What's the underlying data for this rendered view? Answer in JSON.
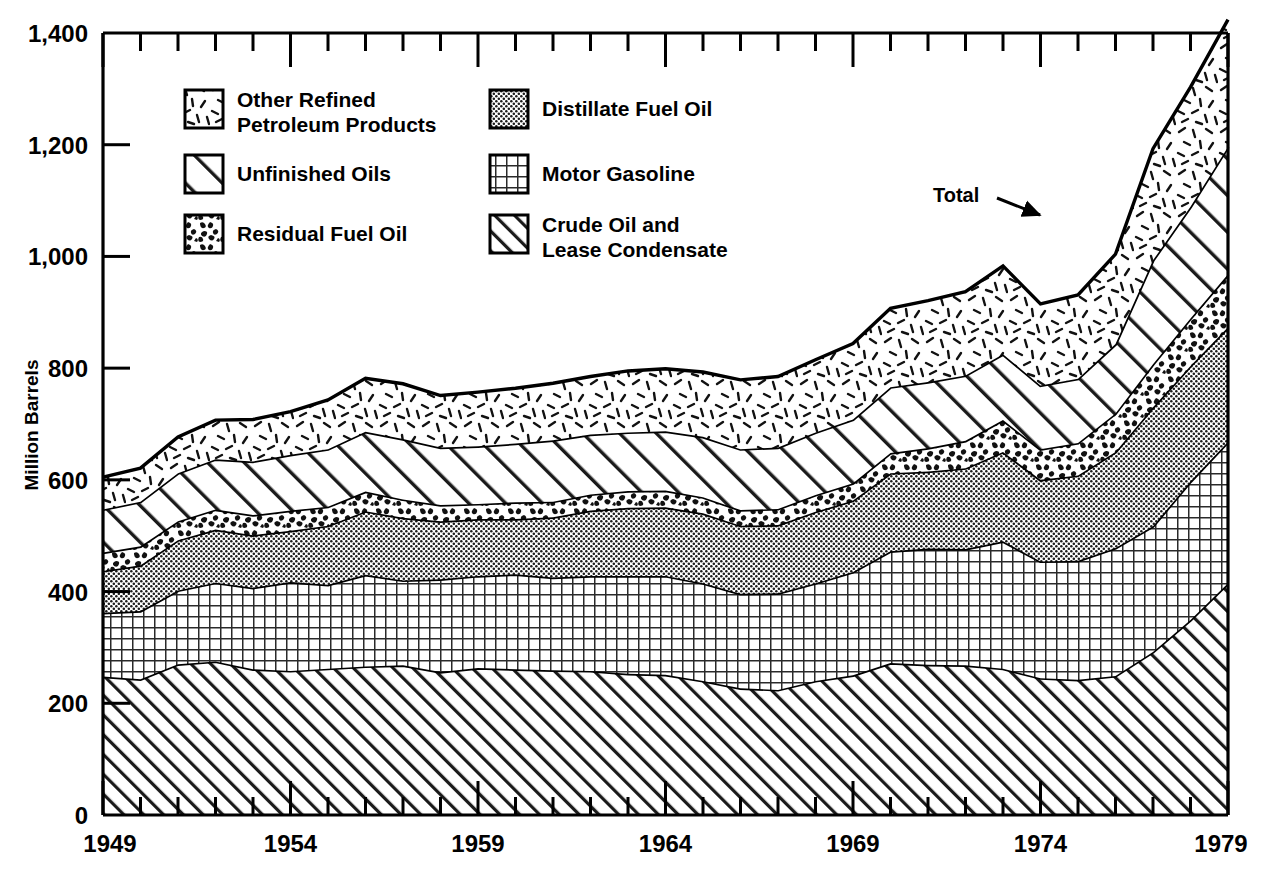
{
  "figure": {
    "axis_y_label": "Million Barrels",
    "annotation_total": "Total"
  },
  "legend": {
    "items": [
      {
        "key": "other_refined",
        "label_line1": "Other Refined",
        "label_line2": "Petroleum Products",
        "pattern": "dashes"
      },
      {
        "key": "distillate",
        "label_line1": "Distillate Fuel Oil",
        "label_line2": "",
        "pattern": "fine-dots"
      },
      {
        "key": "unfinished",
        "label_line1": "Unfinished Oils",
        "label_line2": "",
        "pattern": "wide-diagonal"
      },
      {
        "key": "motor_gasoline",
        "label_line1": "Motor Gasoline",
        "label_line2": "",
        "pattern": "grid"
      },
      {
        "key": "residual",
        "label_line1": "Residual Fuel Oil",
        "label_line2": "",
        "pattern": "speckle"
      },
      {
        "key": "crude",
        "label_line1": "Crude Oil and",
        "label_line2": "Lease Condensate",
        "pattern": "diagonal"
      }
    ]
  },
  "chart_data": {
    "type": "area",
    "title": "",
    "xlabel": "",
    "ylabel": "Million Barrels",
    "xlim": [
      1949,
      1979
    ],
    "ylim": [
      0,
      1400
    ],
    "ytick_labels": [
      "0",
      "200",
      "400",
      "600",
      "800",
      "1,000",
      "1,200",
      "1,400"
    ],
    "ytick_values": [
      0,
      200,
      400,
      600,
      800,
      1000,
      1200,
      1400
    ],
    "xtick_labels": [
      "1949",
      "1954",
      "1959",
      "1964",
      "1969",
      "1974",
      "1979"
    ],
    "xtick_values": [
      1949,
      1954,
      1959,
      1964,
      1969,
      1974,
      1979
    ],
    "minor_ticks": true,
    "grid": false,
    "legend_position": "upper-left-inside",
    "stacked": true,
    "stack_order_bottom_to_top": [
      "crude",
      "motor_gasoline",
      "distillate",
      "residual",
      "unfinished",
      "other_refined"
    ],
    "x": [
      1949,
      1950,
      1951,
      1952,
      1953,
      1954,
      1955,
      1956,
      1957,
      1958,
      1959,
      1960,
      1961,
      1962,
      1963,
      1964,
      1965,
      1966,
      1967,
      1968,
      1969,
      1970,
      1971,
      1972,
      1973,
      1974,
      1975,
      1976,
      1977,
      1978,
      1979
    ],
    "series": [
      {
        "name": "Crude Oil and Lease Condensate",
        "values": [
          248,
          243,
          270,
          275,
          261,
          258,
          262,
          266,
          268,
          256,
          263,
          261,
          259,
          258,
          253,
          251,
          240,
          227,
          224,
          240,
          250,
          272,
          269,
          268,
          262,
          245,
          242,
          249,
          292,
          349,
          415
        ]
      },
      {
        "name": "Motor Gasoline",
        "values": [
          114,
          122,
          132,
          141,
          146,
          159,
          150,
          164,
          152,
          166,
          165,
          170,
          166,
          170,
          175,
          177,
          175,
          169,
          173,
          175,
          185,
          200,
          208,
          208,
          228,
          209,
          213,
          229,
          225,
          248,
          253
        ]
      },
      {
        "name": "Distillate Fuel Oil",
        "values": [
          75,
          82,
          90,
          95,
          94,
          92,
          106,
          114,
          112,
          104,
          102,
          99,
          108,
          117,
          122,
          123,
          125,
          122,
          122,
          128,
          128,
          140,
          138,
          145,
          160,
          146,
          153,
          172,
          213,
          207,
          205
        ]
      },
      {
        "name": "Residual Fuel Oil",
        "values": [
          33,
          34,
          34,
          36,
          36,
          36,
          34,
          35,
          33,
          29,
          27,
          30,
          28,
          29,
          30,
          30,
          29,
          28,
          29,
          30,
          31,
          36,
          42,
          49,
          57,
          55,
          58,
          69,
          77,
          85,
          95
        ]
      },
      {
        "name": "Unfinished Oils",
        "values": [
          77,
          80,
          86,
          90,
          96,
          100,
          103,
          107,
          108,
          103,
          103,
          105,
          110,
          107,
          105,
          106,
          108,
          109,
          110,
          112,
          114,
          118,
          118,
          117,
          118,
          114,
          115,
          124,
          186,
          200,
          228
        ]
      },
      {
        "name": "Other Refined Petroleum Products",
        "values": [
          58,
          60,
          65,
          70,
          75,
          77,
          88,
          96,
          99,
          93,
          97,
          99,
          102,
          104,
          110,
          112,
          116,
          124,
          127,
          130,
          136,
          141,
          146,
          150,
          158,
          146,
          150,
          161,
          200,
          214,
          228
        ]
      }
    ],
    "total_note": "Top boundary of the stack is labelled 'Total'"
  }
}
